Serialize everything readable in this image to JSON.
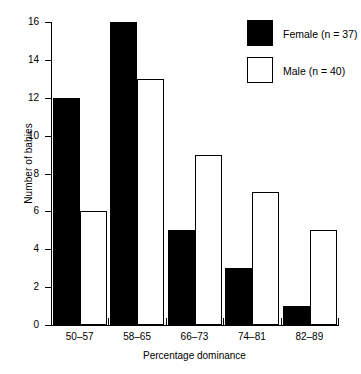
{
  "chart_data": {
    "type": "bar",
    "title": "",
    "xlabel": "Percentage dominance",
    "ylabel": "Number of babies",
    "categories": [
      "50–57",
      "58–65",
      "66–73",
      "74–81",
      "82–89"
    ],
    "series": [
      {
        "name": "Female (n = 37)",
        "values": [
          12,
          16,
          5,
          3,
          1
        ],
        "fill": "#000000",
        "swatch": "filled"
      },
      {
        "name": "Male (n = 40)",
        "values": [
          6,
          13,
          9,
          7,
          5
        ],
        "fill": "#ffffff",
        "swatch": "hollow"
      }
    ],
    "ylim": [
      0,
      16
    ],
    "ytick_values": [
      0,
      2,
      4,
      6,
      8,
      10,
      12,
      14,
      16
    ],
    "ytick_labels": [
      "0",
      "2",
      "4",
      "6",
      "8",
      "10",
      "12",
      "14",
      "16"
    ],
    "grid": false,
    "legend_position": "top-right",
    "axis_color": "#000000"
  },
  "legend": {
    "entries": [
      {
        "label": "Female (n = 37)"
      },
      {
        "label": "Male (n = 40)"
      }
    ]
  }
}
